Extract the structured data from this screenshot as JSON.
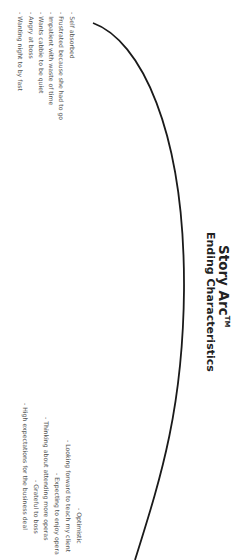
{
  "document": {
    "title": "Story Arc",
    "title_mark": "TM",
    "subtitle": "Ending Characteristics"
  },
  "beginning_traits": [
    "- Self absorbed",
    "- Frustrated because she had to go",
    "- Impatient with waste of time",
    "- Wants cabbie to be quiet",
    "- Angry at boss",
    "- Wanting night to by fast"
  ],
  "ending_traits": [
    "- Optimistic",
    "- Looking forward to teach my client",
    "- Expecting to enjoy opera",
    "- Thinking about attending more operas",
    "- Grateful to boss",
    "- High expectations for the business deal"
  ],
  "colors": {
    "background": "#ffffff",
    "arc": "#1a1a1a",
    "text": "#555555",
    "title": "#222222"
  }
}
